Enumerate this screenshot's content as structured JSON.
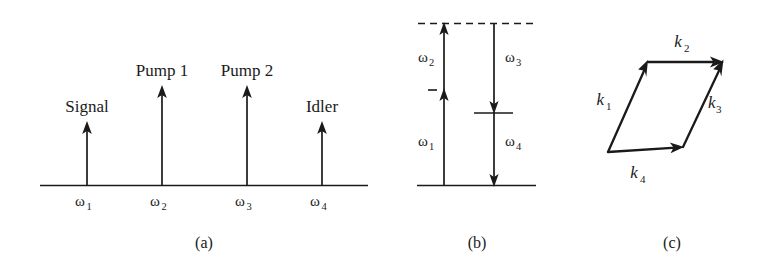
{
  "figure": {
    "background_color": "#ffffff",
    "ink_color": "#1a1a1a",
    "panel_captions": {
      "a": "(a)",
      "b": "(b)",
      "c": "(c)"
    }
  },
  "panel_a": {
    "caption": "(a)",
    "description": "Frequency spectrum of four-wave mixing showing signal, two pumps and idler",
    "axis_label": "",
    "lines": [
      {
        "name": "Signal",
        "omega_symbol": "ω",
        "omega_subscript": "1",
        "relative_height": 0.6
      },
      {
        "name": "Pump 1",
        "omega_symbol": "ω",
        "omega_subscript": "2",
        "relative_height": 1.0
      },
      {
        "name": "Pump 2",
        "omega_symbol": "ω",
        "omega_subscript": "3",
        "relative_height": 1.0
      },
      {
        "name": "Idler",
        "omega_symbol": "ω",
        "omega_subscript": "4",
        "relative_height": 0.6
      }
    ]
  },
  "panel_b": {
    "caption": "(b)",
    "description": "Energy level diagram with virtual levels; upward photons omega1 and omega2, downward photons omega3 and omega4",
    "upward_transitions": [
      {
        "symbol": "ω",
        "subscript": "1",
        "direction": "up"
      },
      {
        "symbol": "ω",
        "subscript": "2",
        "direction": "up"
      }
    ],
    "downward_transitions": [
      {
        "symbol": "ω",
        "subscript": "3",
        "direction": "down"
      },
      {
        "symbol": "ω",
        "subscript": "4",
        "direction": "down"
      }
    ],
    "levels": [
      {
        "name": "virtual-top-level",
        "style": "dashed"
      },
      {
        "name": "intermediate-level-left",
        "style": "short-tick"
      },
      {
        "name": "intermediate-level-right",
        "style": "short-solid"
      },
      {
        "name": "ground-level",
        "style": "solid"
      }
    ]
  },
  "panel_c": {
    "caption": "(c)",
    "description": "Phase matching vector parallelogram of wave vectors k1 + k2 = k3 + k4",
    "vectors": [
      {
        "symbol": "k",
        "subscript": "1"
      },
      {
        "symbol": "k",
        "subscript": "2"
      },
      {
        "symbol": "k",
        "subscript": "3"
      },
      {
        "symbol": "k",
        "subscript": "4"
      }
    ]
  }
}
